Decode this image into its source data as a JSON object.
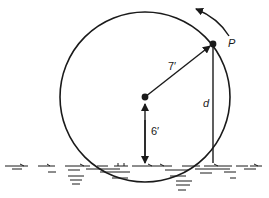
{
  "diagram": {
    "type": "ferris-wheel-geometry",
    "labels": {
      "radius": "7′",
      "center_height": "6′",
      "vertical_distance": "d",
      "point": "P"
    },
    "geometry": {
      "circle": {
        "cx": 145,
        "cy": 97,
        "r": 85
      },
      "center_point": {
        "x": 145,
        "y": 97
      },
      "point_p": {
        "x": 213,
        "y": 44
      },
      "water_line_y": 163
    },
    "colors": {
      "stroke": "#1a1a1a",
      "background": "#ffffff"
    },
    "annotations": {
      "rotation_direction": "counterclockwise"
    }
  }
}
